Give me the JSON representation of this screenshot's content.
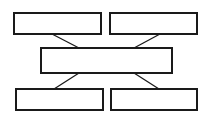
{
  "diagram": {
    "type": "block-diagram",
    "title": "",
    "background_color": "#ffffff",
    "stroke_color": "#1a1a1a",
    "fill_color": "#ffffff",
    "canvas": {
      "width": 213,
      "height": 120
    },
    "nodes": [
      {
        "id": "top-left",
        "label": "",
        "x": 14,
        "y": 13,
        "width": 87,
        "height": 21,
        "row": "top"
      },
      {
        "id": "top-right",
        "label": "",
        "x": 110,
        "y": 13,
        "width": 87,
        "height": 21,
        "row": "top"
      },
      {
        "id": "middle-center",
        "label": "",
        "x": 41,
        "y": 48,
        "width": 131,
        "height": 25,
        "row": "middle"
      },
      {
        "id": "bottom-left",
        "label": "",
        "x": 16,
        "y": 89,
        "width": 87,
        "height": 21,
        "row": "bottom"
      },
      {
        "id": "bottom-right",
        "label": "",
        "x": 111,
        "y": 89,
        "width": 86,
        "height": 21,
        "row": "bottom"
      }
    ],
    "connectors": [
      {
        "id": "top-left-to-middle",
        "from": "top-left",
        "to": "middle-center",
        "x1": 52,
        "y1": 34,
        "x2": 79,
        "y2": 48
      },
      {
        "id": "top-right-to-middle",
        "from": "top-right",
        "to": "middle-center",
        "x1": 160,
        "y1": 34,
        "x2": 134,
        "y2": 48
      },
      {
        "id": "middle-to-bottom-left",
        "from": "middle-center",
        "to": "bottom-left",
        "x1": 79,
        "y1": 73,
        "x2": 54,
        "y2": 89
      },
      {
        "id": "middle-to-bottom-right",
        "from": "middle-center",
        "to": "bottom-right",
        "x1": 134,
        "y1": 73,
        "x2": 159,
        "y2": 89
      }
    ]
  }
}
